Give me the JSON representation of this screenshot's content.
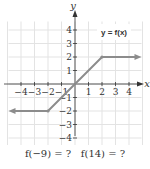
{
  "chart_data": {
    "type": "line",
    "title": "",
    "xlabel": "x",
    "ylabel": "y",
    "xlim": [
      -5,
      5
    ],
    "ylim": [
      -5,
      5
    ],
    "grid": true,
    "x_ticks": [
      -4,
      -3,
      -2,
      -1,
      1,
      2,
      3,
      4
    ],
    "x_tick_labels": [
      "−4",
      "−3",
      "−2",
      "−1",
      "1",
      "2",
      "3",
      "4"
    ],
    "y_ticks": [
      4,
      3,
      2,
      1,
      -1,
      -2,
      -3,
      -4
    ],
    "y_tick_labels": [
      "4",
      "3",
      "2",
      "1",
      "−1",
      "−2",
      "−3",
      "−4"
    ],
    "series": [
      {
        "name": "y = f(x)",
        "points": [
          [
            -5,
            -2
          ],
          [
            -2,
            -2
          ],
          [
            2,
            2
          ],
          [
            5,
            2
          ]
        ],
        "left_arrow": true,
        "right_arrow": true,
        "color": "#8c8c8c"
      }
    ],
    "legend": {
      "text": "y = f(x)",
      "position": "top-right"
    }
  },
  "caption": {
    "q1": "f(−9) = ?",
    "q2": "f(14) = ?"
  }
}
